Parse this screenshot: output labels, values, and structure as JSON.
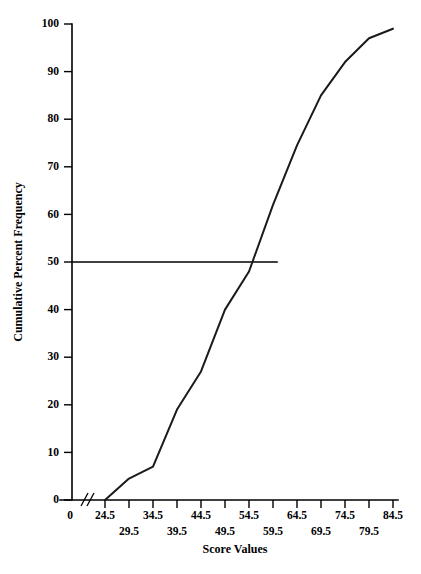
{
  "chart_data": {
    "type": "line",
    "title": "",
    "subtitle": "",
    "xlabel": "Score Values",
    "ylabel": "Cumulative Percent Frequency",
    "xlim": [
      24.5,
      84.5
    ],
    "ylim": [
      0,
      100
    ],
    "grid": false,
    "legend": "none",
    "x_tick_labels": [
      "0",
      "24.5",
      "29.5",
      "34.5",
      "39.5",
      "44.5",
      "49.5",
      "54.5",
      "59.5",
      "64.5",
      "69.5",
      "74.5",
      "79.5",
      "84.5"
    ],
    "y_tick_labels": [
      "0",
      "10",
      "20",
      "30",
      "40",
      "50",
      "60",
      "70",
      "80",
      "90",
      "100"
    ],
    "x": [
      24.5,
      29.5,
      34.5,
      39.5,
      44.5,
      49.5,
      54.5,
      59.5,
      64.5,
      69.5,
      74.5,
      79.5,
      84.5
    ],
    "values": [
      0,
      4.5,
      7,
      19,
      27,
      40,
      48,
      62,
      74.5,
      85,
      92,
      97,
      99
    ],
    "series": [
      {
        "name": "Cumulative Percent Frequency",
        "x": [
          24.5,
          29.5,
          34.5,
          39.5,
          44.5,
          49.5,
          54.5,
          59.5,
          64.5,
          69.5,
          74.5,
          79.5,
          84.5
        ],
        "values": [
          0,
          4.5,
          7,
          19,
          27,
          40,
          48,
          62,
          74.5,
          85,
          92,
          97,
          99
        ]
      }
    ],
    "annotations": [
      {
        "name": "median-reference-line",
        "type": "horizontal-line",
        "y": 50,
        "x_start": 24.5,
        "x_end": 60.5,
        "label": ""
      },
      {
        "name": "x-axis-break",
        "type": "axis-break",
        "between": [
          0,
          24.5
        ],
        "label": ""
      }
    ],
    "axis_origin_label": "0"
  },
  "axes": {
    "y_title": "Cumulative Percent Frequency",
    "x_title": "Score Values",
    "y_ticks": [
      {
        "label": "0",
        "value": 0
      },
      {
        "label": "10",
        "value": 10
      },
      {
        "label": "20",
        "value": 20
      },
      {
        "label": "30",
        "value": 30
      },
      {
        "label": "40",
        "value": 40
      },
      {
        "label": "50",
        "value": 50
      },
      {
        "label": "60",
        "value": 60
      },
      {
        "label": "70",
        "value": 70
      },
      {
        "label": "80",
        "value": 80
      },
      {
        "label": "90",
        "value": 90
      },
      {
        "label": "100",
        "value": 100
      }
    ],
    "x_ticks": [
      {
        "label": "0",
        "value": 19.5,
        "row": "upper"
      },
      {
        "label": "24.5",
        "value": 24.5,
        "row": "upper"
      },
      {
        "label": "29.5",
        "value": 29.5,
        "row": "lower"
      },
      {
        "label": "34.5",
        "value": 34.5,
        "row": "upper"
      },
      {
        "label": "39.5",
        "value": 39.5,
        "row": "lower"
      },
      {
        "label": "44.5",
        "value": 44.5,
        "row": "upper"
      },
      {
        "label": "49.5",
        "value": 49.5,
        "row": "lower"
      },
      {
        "label": "54.5",
        "value": 54.5,
        "row": "upper"
      },
      {
        "label": "59.5",
        "value": 59.5,
        "row": "lower"
      },
      {
        "label": "64.5",
        "value": 64.5,
        "row": "upper"
      },
      {
        "label": "69.5",
        "value": 69.5,
        "row": "lower"
      },
      {
        "label": "74.5",
        "value": 74.5,
        "row": "upper"
      },
      {
        "label": "79.5",
        "value": 79.5,
        "row": "lower"
      },
      {
        "label": "84.5",
        "value": 84.5,
        "row": "upper"
      }
    ]
  },
  "colors": {
    "curve": "#1a1a1a",
    "axis": "#000000",
    "background": "#ffffff",
    "reference_line": "#000000"
  }
}
